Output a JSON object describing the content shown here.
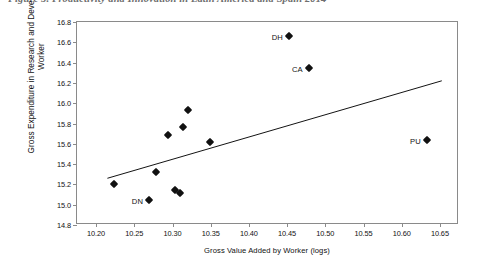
{
  "caption": "Figure 5. Productivity and Innovation in Latin America and Spain 2014",
  "chart_data": {
    "type": "scatter",
    "title": "",
    "xlabel": "Gross Value Added by Worker (logs)",
    "ylabel": "Gross Expenditure in Research and Development by Worker",
    "xlim": [
      10.175,
      10.675
    ],
    "ylim": [
      14.8,
      16.8
    ],
    "xticks": [
      "10.20",
      "10.25",
      "10.30",
      "10.35",
      "10.40",
      "10.45",
      "10.50",
      "10.55",
      "10.60",
      "10.65"
    ],
    "xtick_values": [
      10.2,
      10.25,
      10.3,
      10.35,
      10.4,
      10.45,
      10.5,
      10.55,
      10.6,
      10.65
    ],
    "yticks": [
      "14.8",
      "15.0",
      "15.2",
      "15.4",
      "15.6",
      "15.8",
      "16.0",
      "16.2",
      "16.4",
      "16.6",
      "16.8"
    ],
    "ytick_values": [
      14.8,
      15.0,
      15.2,
      15.4,
      15.6,
      15.8,
      16.0,
      16.2,
      16.4,
      16.6,
      16.8
    ],
    "grid": false,
    "legend": false,
    "marker": "filled-diamond",
    "marker_color": "#111111",
    "trendline": {
      "visible": true,
      "color": "#111111",
      "x_start": 10.215,
      "y_start": 15.245,
      "x_end": 10.655,
      "y_end": 16.215
    },
    "points": [
      {
        "label": "",
        "x": 10.2235,
        "y": 15.205
      },
      {
        "label": "DN",
        "x": 10.2695,
        "y": 15.045
      },
      {
        "label": "",
        "x": 10.278,
        "y": 15.325
      },
      {
        "label": "",
        "x": 10.294,
        "y": 15.685
      },
      {
        "label": "",
        "x": 10.303,
        "y": 15.145
      },
      {
        "label": "",
        "x": 10.31,
        "y": 15.12
      },
      {
        "label": "",
        "x": 10.314,
        "y": 15.765
      },
      {
        "label": "",
        "x": 10.3205,
        "y": 15.935
      },
      {
        "label": "",
        "x": 10.3495,
        "y": 15.615
      },
      {
        "label": "DH",
        "x": 10.4525,
        "y": 16.665
      },
      {
        "label": "CA",
        "x": 10.4785,
        "y": 16.345
      },
      {
        "label": "PU",
        "x": 10.633,
        "y": 15.64
      }
    ]
  }
}
